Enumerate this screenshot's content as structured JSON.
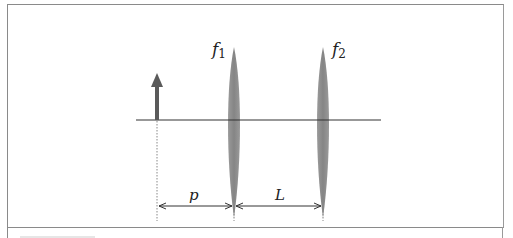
{
  "diagram": {
    "type": "optics-two-lens-system",
    "labels": {
      "lens1": {
        "symbol": "f",
        "subscript": "1"
      },
      "lens2": {
        "symbol": "f",
        "subscript": "2"
      },
      "object_distance": "p",
      "lens_separation": "L"
    },
    "elements": [
      {
        "id": "object",
        "kind": "arrow",
        "x": 157,
        "y_top": 73,
        "y_base": 120,
        "color": "#5a5a5a"
      },
      {
        "id": "lens1",
        "kind": "convex-lens",
        "x": 234,
        "y_top": 48,
        "y_bottom": 218,
        "color": "#8c8c8c"
      },
      {
        "id": "lens2",
        "kind": "convex-lens",
        "x": 323,
        "y_top": 48,
        "y_bottom": 218,
        "color": "#8c8c8c"
      },
      {
        "id": "optical-axis",
        "kind": "line",
        "x1": 136,
        "x2": 381,
        "y": 120,
        "color": "#333333"
      },
      {
        "id": "dim-p",
        "kind": "dimension",
        "x1": 157,
        "x2": 234,
        "y": 206
      },
      {
        "id": "dim-L",
        "kind": "dimension",
        "x1": 234,
        "x2": 323,
        "y": 206
      }
    ],
    "colors": {
      "lens": "#8c8c8c",
      "arrow": "#5a5a5a",
      "axis": "#333333",
      "frame": "#8a8a8a"
    }
  }
}
